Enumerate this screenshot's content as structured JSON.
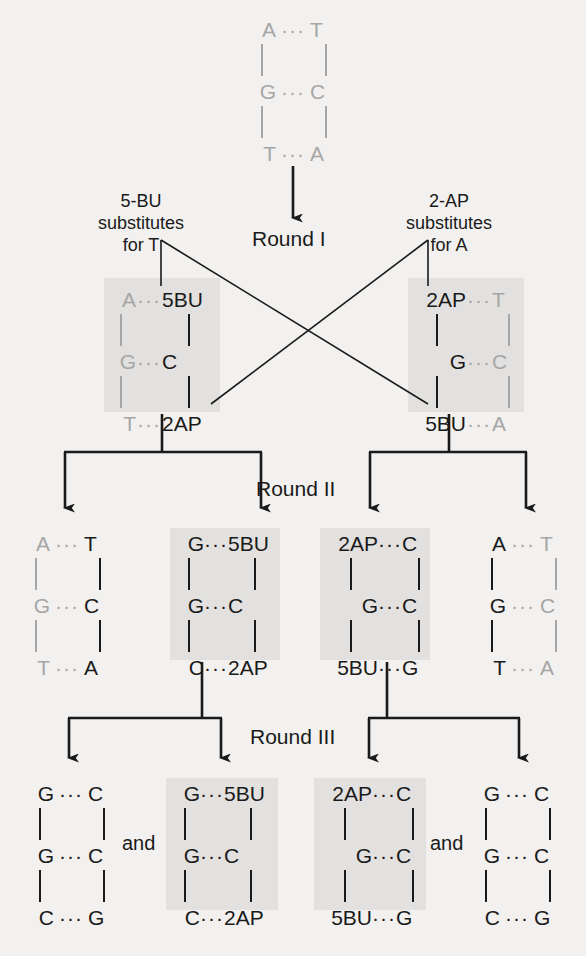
{
  "diagram": {
    "background_color": "#f2f1ef",
    "shade_color": "#e2e1df",
    "black": "#1a1a1a",
    "gray": "#a6a6a6",
    "pair_separator": "···",
    "and_label": "and"
  },
  "round_labels": {
    "one": "Round I",
    "two": "Round II",
    "three": "Round III"
  },
  "substitution_labels": {
    "left": [
      "5-BU",
      "substitutes",
      "for T"
    ],
    "right": [
      "2-AP",
      "substitutes",
      "for A"
    ]
  },
  "original": {
    "name": "original-duplex",
    "shaded": false,
    "rows": [
      {
        "left": "A",
        "right": "T",
        "left_color": "gray",
        "right_color": "gray"
      },
      {
        "left": "G",
        "right": "C",
        "left_color": "gray",
        "right_color": "gray"
      },
      {
        "left": "T",
        "right": "A",
        "left_color": "gray",
        "right_color": "gray"
      }
    ]
  },
  "round1": [
    {
      "name": "round1-left-duplex",
      "shaded": true,
      "rows": [
        {
          "left": "A",
          "right": "5BU",
          "left_color": "gray",
          "right_color": "black"
        },
        {
          "left": "G",
          "right": "C",
          "left_color": "gray",
          "right_color": "black"
        },
        {
          "left": "T",
          "right": "2AP",
          "left_color": "gray",
          "right_color": "black"
        }
      ]
    },
    {
      "name": "round1-right-duplex",
      "shaded": true,
      "rows": [
        {
          "left": "2AP",
          "right": "T",
          "left_color": "black",
          "right_color": "gray"
        },
        {
          "left": "G",
          "right": "C",
          "left_color": "black",
          "right_color": "gray"
        },
        {
          "left": "5BU",
          "right": "A",
          "left_color": "black",
          "right_color": "gray"
        }
      ]
    }
  ],
  "round2": [
    {
      "name": "round2-duplex-1",
      "shaded": false,
      "rows": [
        {
          "left": "A",
          "right": "T",
          "left_color": "gray",
          "right_color": "black"
        },
        {
          "left": "G",
          "right": "C",
          "left_color": "gray",
          "right_color": "black"
        },
        {
          "left": "T",
          "right": "A",
          "left_color": "gray",
          "right_color": "black"
        }
      ]
    },
    {
      "name": "round2-duplex-2",
      "shaded": true,
      "rows": [
        {
          "left": "G",
          "right": "5BU",
          "left_color": "black",
          "right_color": "black"
        },
        {
          "left": "G",
          "right": "C",
          "left_color": "black",
          "right_color": "black"
        },
        {
          "left": "C",
          "right": "2AP",
          "left_color": "black",
          "right_color": "black"
        }
      ]
    },
    {
      "name": "round2-duplex-3",
      "shaded": true,
      "rows": [
        {
          "left": "2AP",
          "right": "C",
          "left_color": "black",
          "right_color": "black"
        },
        {
          "left": "G",
          "right": "C",
          "left_color": "black",
          "right_color": "black"
        },
        {
          "left": "5BU",
          "right": "G",
          "left_color": "black",
          "right_color": "black"
        }
      ]
    },
    {
      "name": "round2-duplex-4",
      "shaded": false,
      "rows": [
        {
          "left": "A",
          "right": "T",
          "left_color": "black",
          "right_color": "gray"
        },
        {
          "left": "G",
          "right": "C",
          "left_color": "black",
          "right_color": "gray"
        },
        {
          "left": "T",
          "right": "A",
          "left_color": "black",
          "right_color": "gray"
        }
      ]
    }
  ],
  "round3": [
    {
      "name": "round3-duplex-1",
      "shaded": false,
      "rows": [
        {
          "left": "G",
          "right": "C",
          "left_color": "black",
          "right_color": "black"
        },
        {
          "left": "G",
          "right": "C",
          "left_color": "black",
          "right_color": "black"
        },
        {
          "left": "C",
          "right": "G",
          "left_color": "black",
          "right_color": "black"
        }
      ]
    },
    {
      "name": "round3-duplex-2",
      "shaded": true,
      "rows": [
        {
          "left": "G",
          "right": "5BU",
          "left_color": "black",
          "right_color": "black"
        },
        {
          "left": "G",
          "right": "C",
          "left_color": "black",
          "right_color": "black"
        },
        {
          "left": "C",
          "right": "2AP",
          "left_color": "black",
          "right_color": "black"
        }
      ]
    },
    {
      "name": "round3-duplex-3",
      "shaded": true,
      "rows": [
        {
          "left": "2AP",
          "right": "C",
          "left_color": "black",
          "right_color": "black"
        },
        {
          "left": "G",
          "right": "C",
          "left_color": "black",
          "right_color": "black"
        },
        {
          "left": "5BU",
          "right": "G",
          "left_color": "black",
          "right_color": "black"
        }
      ]
    },
    {
      "name": "round3-duplex-4",
      "shaded": false,
      "rows": [
        {
          "left": "G",
          "right": "C",
          "left_color": "black",
          "right_color": "black"
        },
        {
          "left": "G",
          "right": "C",
          "left_color": "black",
          "right_color": "black"
        },
        {
          "left": "C",
          "right": "G",
          "left_color": "black",
          "right_color": "black"
        }
      ]
    }
  ]
}
